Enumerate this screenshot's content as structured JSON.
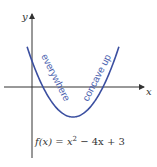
{
  "diagram": {
    "axis_labels": {
      "x": "x",
      "y": "y"
    },
    "function": {
      "expression": "x^2 - 4x + 3",
      "coefficients": {
        "a": 1,
        "b": -4,
        "c": 3
      },
      "roots": [
        1,
        3
      ],
      "vertex": [
        2,
        -1
      ],
      "x_range": [
        0.47,
        3.53
      ]
    },
    "equation_label": {
      "lhs": "f(x) = x",
      "exp": "2",
      "rhs": " − 4x + 3"
    },
    "annotations": {
      "left": "everywhere",
      "right": "concave up"
    },
    "colors": {
      "curve": "#3b4fa0",
      "annotation": "#4a5fae",
      "axis": "#333333"
    }
  }
}
